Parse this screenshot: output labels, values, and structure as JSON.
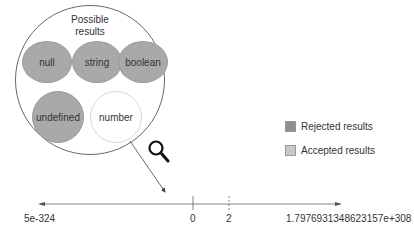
{
  "diagram": {
    "set_title": "Possible\nresults",
    "results": [
      {
        "label": "null",
        "status": "rejected"
      },
      {
        "label": "string",
        "status": "rejected"
      },
      {
        "label": "boolean",
        "status": "rejected"
      },
      {
        "label": "undefined",
        "status": "rejected"
      },
      {
        "label": "number",
        "status": "accepted"
      }
    ],
    "icon": "magnifier-icon"
  },
  "legend": {
    "rejected_label": "Rejected results",
    "accepted_label": "Accepted results",
    "rejected_color": "#8f8f8f",
    "accepted_color": "#c8c8c8"
  },
  "number_line": {
    "min_label": "5e-324",
    "zero_label": "0",
    "two_label": "2",
    "max_label": "1.7976931348623157e+308"
  }
}
